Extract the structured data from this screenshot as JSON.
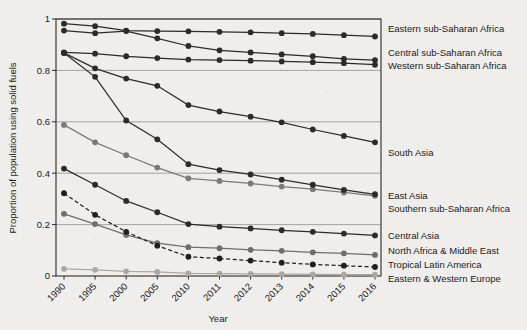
{
  "chart_data": {
    "type": "line",
    "title": "",
    "xlabel": "Year",
    "ylabel": "Proportion of population using solid fuels",
    "categories": [
      "1990",
      "1995",
      "2000",
      "2005",
      "2010",
      "2011",
      "2012",
      "2013",
      "2014",
      "2015",
      "2016"
    ],
    "x_tick_labels": [
      "1990",
      "1995",
      "2000",
      "2005",
      "2010",
      "2011",
      "2012",
      "2013",
      "2014",
      "2015",
      "2016"
    ],
    "y_tick_labels": [
      "0",
      "0.2",
      "0.4",
      "0.6",
      "0.8",
      "1"
    ],
    "y_tick_values": [
      0,
      0.2,
      0.4,
      0.6,
      0.8,
      1
    ],
    "ylim": [
      0,
      1
    ],
    "grid": "horizontal",
    "legend_position": "right-of-axes-inline",
    "series": [
      {
        "name": "Eastern sub-Saharan Africa",
        "color": "#2b2b2b",
        "style": "solid",
        "values": [
          0.982,
          0.972,
          0.955,
          0.953,
          0.952,
          0.95,
          0.948,
          0.945,
          0.942,
          0.937,
          0.932
        ]
      },
      {
        "name": "Central sub-Saharan Africa",
        "color": "#2b2b2b",
        "style": "solid",
        "values": [
          0.955,
          0.945,
          0.953,
          0.925,
          0.895,
          0.878,
          0.87,
          0.862,
          0.855,
          0.845,
          0.84
        ]
      },
      {
        "name": "Western sub-Saharan Africa",
        "color": "#2b2b2b",
        "style": "solid",
        "values": [
          0.87,
          0.865,
          0.855,
          0.848,
          0.842,
          0.84,
          0.838,
          0.835,
          0.832,
          0.828,
          0.822
        ]
      },
      {
        "name": "South Asia",
        "color": "#2b2b2b",
        "style": "solid",
        "values": [
          0.868,
          0.808,
          0.768,
          0.74,
          0.665,
          0.64,
          0.62,
          0.598,
          0.57,
          0.545,
          0.52
        ]
      },
      {
        "name": "Southern sub-Saharan Africa",
        "color": "#7a7a7a",
        "style": "solid",
        "values": [
          0.588,
          0.52,
          0.47,
          0.422,
          0.38,
          0.37,
          0.36,
          0.348,
          0.338,
          0.325,
          0.312
        ]
      },
      {
        "name": "East Asia",
        "color": "#2b2b2b",
        "style": "solid",
        "values": [
          0.868,
          0.775,
          0.605,
          0.532,
          0.435,
          0.412,
          0.395,
          0.375,
          0.355,
          0.335,
          0.318
        ]
      },
      {
        "name": "Central Asia",
        "color": "#2b2b2b",
        "style": "solid",
        "values": [
          0.418,
          0.355,
          0.292,
          0.248,
          0.202,
          0.192,
          0.185,
          0.178,
          0.172,
          0.165,
          0.158
        ]
      },
      {
        "name": "North Africa & Middle East",
        "color": "#6e6e6e",
        "style": "solid",
        "values": [
          0.242,
          0.202,
          0.16,
          0.128,
          0.112,
          0.108,
          0.102,
          0.098,
          0.092,
          0.088,
          0.082
        ]
      },
      {
        "name": "Tropical Latin America",
        "color": "#1f1f1f",
        "style": "dashed",
        "values": [
          0.322,
          0.238,
          0.172,
          0.118,
          0.075,
          0.068,
          0.06,
          0.052,
          0.045,
          0.04,
          0.035
        ]
      },
      {
        "name": "Eastern & Western Europe",
        "color": "#a8a8a8",
        "style": "solid",
        "values": [
          0.028,
          0.024,
          0.018,
          0.016,
          0.01,
          0.009,
          0.008,
          0.007,
          0.006,
          0.005,
          0.005
        ]
      }
    ],
    "legend_entries": [
      {
        "label": "Eastern sub-Saharan Africa",
        "y": 32
      },
      {
        "label": "Central sub-Saharan Africa",
        "y": 56
      },
      {
        "label": "Western sub-Saharan Africa",
        "y": 69
      },
      {
        "label": "South Asia",
        "y": 156
      },
      {
        "label": "East Asia",
        "y": 199
      },
      {
        "label": "Southern sub-Saharan Africa",
        "y": 212
      },
      {
        "label": "Central Asia",
        "y": 239
      },
      {
        "label": "North Africa & Middle East",
        "y": 254
      },
      {
        "label": "Tropical Latin America",
        "y": 268
      },
      {
        "label": "Eastern & Western Europe",
        "y": 282
      }
    ]
  },
  "colors": {
    "background": "#f0eeec",
    "axis": "#2b2b2b",
    "grid": "#9a9a9a",
    "text": "#1a1a1a",
    "black_series": "#2b2b2b",
    "gray_series": "#7a7a7a",
    "light_gray_series": "#a8a8a8"
  }
}
